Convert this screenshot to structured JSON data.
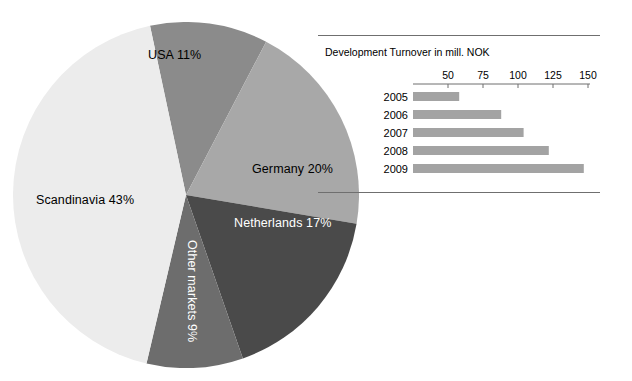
{
  "chart_data": [
    {
      "type": "pie",
      "title": "",
      "legend": "none",
      "unit": "percent",
      "categories": [
        "USA",
        "Germany",
        "Netherlands",
        "Other markets",
        "Scandinavia"
      ],
      "values": [
        11,
        20,
        17,
        9,
        43
      ],
      "labels": [
        "USA 11%",
        "Germany 20%",
        "Netherlands 17%",
        "Other markets 9%",
        "Scandinavia 43%"
      ],
      "colors": [
        "#8b8b8b",
        "#a8a8a8",
        "#4a4a4a",
        "#6d6d6d",
        "#ececec"
      ],
      "label_colors": [
        "#000000",
        "#000000",
        "#ffffff",
        "#ffffff",
        "#000000"
      ],
      "start_angle_deg": -12
    },
    {
      "type": "bar",
      "orientation": "horizontal",
      "title": "Development Turnover in mill. NOK",
      "xlabel": "",
      "ylabel": "",
      "categories": [
        "2005",
        "2006",
        "2007",
        "2008",
        "2009"
      ],
      "values": [
        58,
        88,
        104,
        122,
        147
      ],
      "xlim": [
        25,
        150
      ],
      "ticks": [
        50,
        75,
        100,
        125,
        150
      ],
      "tick_labels": [
        "50",
        "75",
        "100",
        "125",
        "150"
      ],
      "grid": false,
      "bar_color": "#a3a3a3",
      "axis_color": "#6f6f6f"
    }
  ],
  "pie": {
    "slices": [
      {
        "name": "usa",
        "label": "USA 11%",
        "value": 11
      },
      {
        "name": "germany",
        "label": "Germany 20%",
        "value": 20
      },
      {
        "name": "netherlands",
        "label": "Netherlands 17%",
        "value": 17
      },
      {
        "name": "other-markets",
        "label": "Other markets 9%",
        "value": 9
      },
      {
        "name": "scandinavia",
        "label": "Scandinavia 43%",
        "value": 43
      }
    ]
  },
  "bar_panel": {
    "title": "Development Turnover in mill. NOK",
    "rows": [
      {
        "year": "2005",
        "value": 58
      },
      {
        "year": "2006",
        "value": 88
      },
      {
        "year": "2007",
        "value": 104
      },
      {
        "year": "2008",
        "value": 122
      },
      {
        "year": "2009",
        "value": 147
      }
    ],
    "axis_labels": [
      "50",
      "75",
      "100",
      "125",
      "150"
    ]
  }
}
